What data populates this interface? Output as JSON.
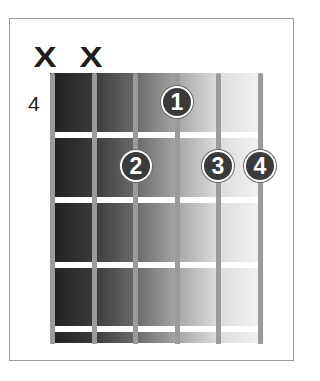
{
  "diagram": {
    "type": "guitar-chord-chart",
    "starting_fret_label": "4",
    "strings_count": 6,
    "frets_shown": 4,
    "colors": {
      "gradient_dark": "#1f1f1f",
      "gradient_light": "#f4f4f4",
      "string": "#9b9b9b",
      "fret": "#ffffff",
      "dot": "#3a3a3a",
      "frame": "#9a9a9a"
    },
    "mutes": [
      {
        "string": 6,
        "label": "X"
      },
      {
        "string": 5,
        "label": "X"
      }
    ],
    "fingers": [
      {
        "finger": "1",
        "string": 3,
        "fret": 1
      },
      {
        "finger": "2",
        "string": 4,
        "fret": 2
      },
      {
        "finger": "3",
        "string": 2,
        "fret": 2
      },
      {
        "finger": "4",
        "string": 1,
        "fret": 2
      }
    ]
  }
}
